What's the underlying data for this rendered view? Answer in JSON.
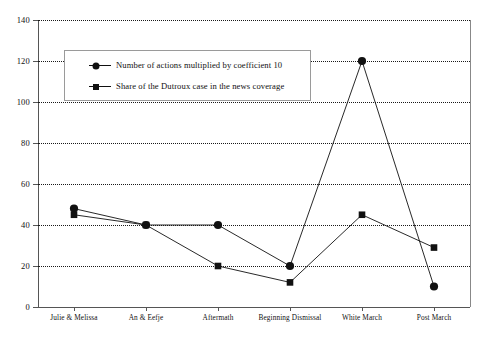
{
  "chart_data": {
    "type": "line",
    "title": "",
    "xlabel": "",
    "ylabel": "",
    "ylim": [
      0,
      140
    ],
    "yticks": [
      0,
      20,
      40,
      60,
      80,
      100,
      120,
      140
    ],
    "grid": true,
    "legend_position": "top-left-inside",
    "categories": [
      "Julie & Melissa",
      "An & Eefje",
      "Aftermath",
      "Beginning Dismissal",
      "White March",
      "Post March"
    ],
    "series": [
      {
        "name": "Number of actions multiplied by coefficient 10",
        "marker": "circle",
        "values": [
          48,
          40,
          40,
          20,
          120,
          10
        ]
      },
      {
        "name": "Share of the Dutroux case in the news coverage",
        "marker": "square",
        "values": [
          45,
          40,
          20,
          12,
          45,
          29
        ]
      }
    ]
  },
  "legend": {
    "items": [
      {
        "label": "Number of actions multiplied by coefficient 10",
        "marker": "circle-marker-icon"
      },
      {
        "label": "Share of the Dutroux case in the news coverage",
        "marker": "square-marker-icon"
      }
    ]
  },
  "colors": {
    "series_line": "#111111",
    "grid": "#1a1a1a",
    "axis": "#555555",
    "background": "#ffffff"
  }
}
